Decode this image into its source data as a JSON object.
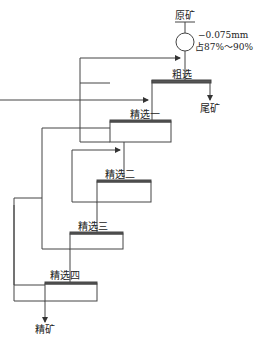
{
  "diagram": {
    "feed_label": "原矿",
    "grind_spec_line1": "−0.075mm",
    "grind_spec_line2": "占87%～90%",
    "stages": [
      {
        "label": "粗选"
      },
      {
        "label": "精选一"
      },
      {
        "label": "精选二"
      },
      {
        "label": "精选三"
      },
      {
        "label": "精选四"
      }
    ],
    "tailings_label": "尾矿",
    "concentrate_label": "精矿",
    "colors": {
      "line": "#333333",
      "cell_top": "#555555"
    }
  }
}
